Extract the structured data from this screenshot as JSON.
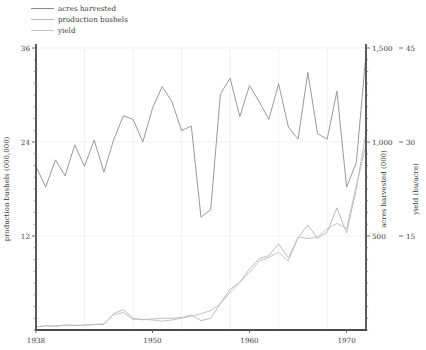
{
  "chart_data": {
    "type": "line",
    "title": "",
    "xlabel": "",
    "grid": true,
    "legend_position": "top-left",
    "x": [
      1938,
      1939,
      1940,
      1941,
      1942,
      1943,
      1944,
      1945,
      1946,
      1947,
      1948,
      1949,
      1950,
      1951,
      1952,
      1953,
      1954,
      1955,
      1956,
      1957,
      1958,
      1959,
      1960,
      1961,
      1962,
      1963,
      1964,
      1965,
      1966,
      1967,
      1968,
      1969,
      1970,
      1971,
      1972
    ],
    "xlim": [
      1938,
      1972
    ],
    "xticks": [
      1938,
      1950,
      1960,
      1970
    ],
    "xticklabels": [
      "1938",
      "1950",
      "1960",
      "1970"
    ],
    "axes": [
      {
        "id": "production",
        "side": "left",
        "label": "production bushels (000,000)",
        "ticks": [
          12,
          24,
          36
        ],
        "ticklabels": [
          "12",
          "24",
          "36"
        ],
        "lim": [
          0,
          36
        ]
      },
      {
        "id": "acres",
        "side": "right-inner",
        "label": "acres harvested (000)",
        "ticks": [
          500,
          1000,
          1500
        ],
        "ticklabels": [
          "500",
          "1,000",
          "1,500"
        ],
        "lim": [
          0,
          1500
        ]
      },
      {
        "id": "yield",
        "side": "right-outer",
        "label": "yield (bu/acre)",
        "ticks": [
          15,
          30,
          45
        ],
        "ticklabels": [
          "15",
          "30",
          "45"
        ],
        "lim": [
          0,
          45
        ]
      }
    ],
    "series": [
      {
        "name": "acres harvested",
        "axis": "acres",
        "color": "#8d8d8d",
        "values": [
          870,
          760,
          905,
          820,
          985,
          870,
          1010,
          840,
          1010,
          1140,
          1120,
          1000,
          1180,
          1295,
          1215,
          1060,
          1085,
          600,
          640,
          1255,
          1340,
          1135,
          1300,
          1215,
          1120,
          1310,
          1080,
          1015,
          1370,
          1045,
          1015,
          1270,
          760,
          890,
          1470
        ]
      },
      {
        "name": "production bushels",
        "axis": "production",
        "color": "#b4b4b4",
        "values": [
          0.4,
          0.5,
          0.5,
          0.6,
          0.6,
          0.6,
          0.7,
          0.7,
          2.1,
          2.6,
          1.5,
          1.3,
          1.4,
          1.5,
          1.5,
          1.6,
          1.9,
          1.2,
          1.5,
          3.4,
          5.2,
          6.1,
          7.8,
          9.1,
          9.5,
          11.0,
          9.2,
          11.8,
          13.4,
          11.7,
          12.5,
          15.6,
          12.4,
          18.0,
          25.2
        ]
      },
      {
        "name": "yield",
        "axis": "yield",
        "color": "#bdbdbd",
        "values": [
          0.5,
          0.7,
          0.6,
          0.8,
          0.7,
          0.8,
          0.9,
          1.0,
          2.4,
          2.8,
          1.7,
          1.7,
          1.6,
          1.4,
          1.6,
          1.9,
          2.2,
          2.6,
          3.1,
          4.2,
          6.0,
          7.6,
          9.2,
          11.0,
          11.6,
          12.4,
          11.0,
          14.8,
          14.6,
          14.8,
          16.2,
          17.0,
          16.2,
          23.0,
          29.5
        ]
      }
    ]
  },
  "legend": {
    "items": [
      {
        "label": "acres harvested"
      },
      {
        "label": "production bushels"
      },
      {
        "label": "yield"
      }
    ]
  }
}
